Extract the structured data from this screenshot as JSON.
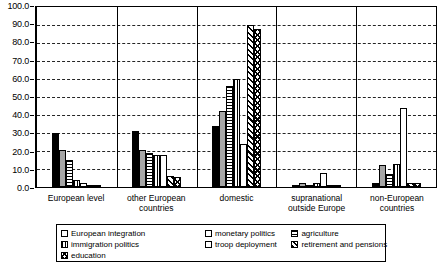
{
  "chart_data": {
    "type": "bar",
    "title": "",
    "subtitle": "",
    "xlabel": "",
    "ylabel": "",
    "ylim": [
      0,
      100
    ],
    "y_ticks": [
      "0.0",
      "10.0",
      "20.0",
      "30.0",
      "40.0",
      "50.0",
      "60.0",
      "70.0",
      "80.0",
      "90.0",
      "100.0"
    ],
    "y_tick_values": [
      0,
      10,
      20,
      30,
      40,
      50,
      60,
      70,
      80,
      90,
      100
    ],
    "grid": "horizontal-dashed",
    "legend_position": "bottom",
    "categories": [
      "European level",
      "other European countries",
      "domestic",
      "supranational outside Europe",
      "non-European countries"
    ],
    "category_labels": [
      "European level",
      "other European\ncountries",
      "domestic",
      "supranational\noutside Europe",
      "non-European\ncountries"
    ],
    "series": [
      {
        "name": "European integration",
        "pattern": "solid-black",
        "color": "#000000",
        "values": [
          30.0,
          31.0,
          34.0,
          0.5,
          2.5
        ]
      },
      {
        "name": "monetary politics",
        "pattern": "gray",
        "color": "#a6a6a6",
        "values": [
          20.5,
          20.5,
          42.0,
          2.0,
          12.0
        ]
      },
      {
        "name": "agriculture",
        "pattern": "horizontal-stripes",
        "color": "#ffffff",
        "values": [
          15.0,
          19.0,
          56.0,
          1.0,
          7.0
        ]
      },
      {
        "name": "immigration politics",
        "pattern": "vertical-stripes",
        "color": "#ffffff",
        "values": [
          4.0,
          18.0,
          60.0,
          2.5,
          13.0
        ]
      },
      {
        "name": "troop deployment",
        "pattern": "white",
        "color": "#ffffff",
        "values": [
          2.0,
          18.0,
          24.0,
          8.0,
          44.0
        ]
      },
      {
        "name": "retirement and pensions",
        "pattern": "diagonal-hatch",
        "color": "#ffffff",
        "values": [
          1.0,
          6.0,
          90.0,
          1.0,
          2.0
        ]
      },
      {
        "name": "education",
        "pattern": "chevron-hatch",
        "color": "#ffffff",
        "values": [
          0.3,
          5.5,
          88.0,
          0.3,
          2.0
        ]
      }
    ]
  },
  "legend": {
    "items": [
      {
        "label": "European integration",
        "pattern": "solid-black"
      },
      {
        "label": "monetary politics",
        "pattern": "gray"
      },
      {
        "label": "agriculture",
        "pattern": "horizontal-stripes"
      },
      {
        "label": "immigration politics",
        "pattern": "vertical-stripes"
      },
      {
        "label": "troop deployment",
        "pattern": "white"
      },
      {
        "label": "retirement and pensions",
        "pattern": "diagonal-hatch"
      },
      {
        "label": "education",
        "pattern": "chevron-hatch"
      }
    ]
  }
}
